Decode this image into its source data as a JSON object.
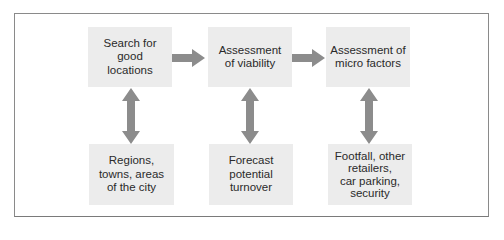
{
  "diagram": {
    "top_row": [
      {
        "id": "search",
        "label": "Search for good locations",
        "lines": [
          "Search for",
          "good",
          "locations"
        ]
      },
      {
        "id": "viability",
        "label": "Assessment of viability",
        "lines": [
          "Assessment",
          "of viability"
        ]
      },
      {
        "id": "micro",
        "label": "Assessment of micro factors",
        "lines": [
          "Assessment of",
          "micro factors"
        ]
      }
    ],
    "bottom_row": [
      {
        "id": "regions",
        "label": "Regions, towns, areas of the city",
        "lines": [
          "Regions,",
          "towns, areas",
          "of the city"
        ]
      },
      {
        "id": "forecast",
        "label": "Forecast potential turnover",
        "lines": [
          "Forecast",
          "potential",
          "turnover"
        ]
      },
      {
        "id": "footfall",
        "label": "Footfall, other retailers, car parking, security",
        "lines": [
          "Footfall, other",
          "retailers,",
          "car parking,",
          "security"
        ]
      }
    ],
    "connections": [
      {
        "from": "search",
        "to": "viability",
        "type": "right-arrow"
      },
      {
        "from": "viability",
        "to": "micro",
        "type": "right-arrow"
      },
      {
        "from": "search",
        "to": "regions",
        "type": "double-vertical-arrow"
      },
      {
        "from": "viability",
        "to": "forecast",
        "type": "double-vertical-arrow"
      },
      {
        "from": "micro",
        "to": "footfall",
        "type": "double-vertical-arrow"
      }
    ],
    "colors": {
      "box_fill": "#ececec",
      "arrow": "#8c8c8c",
      "frame": "#8a8a8a",
      "text": "#2a2a2a"
    }
  }
}
